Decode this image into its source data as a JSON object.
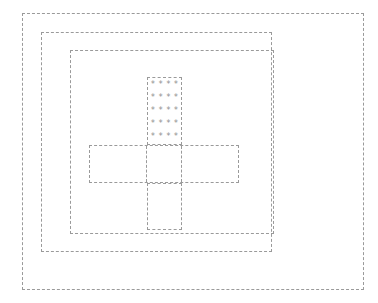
{
  "canvas": {
    "width": 378,
    "height": 303,
    "background_color": "#ffffff",
    "stroke_color": "#9a9a9a",
    "glyph_color": "#8f8f8f",
    "stroke_style": "dashed",
    "stroke_width_px": 1
  },
  "outer_frame": {
    "label": "outer viewport frame",
    "x": 22,
    "y": 13,
    "width": 342,
    "height": 277
  },
  "container_frame": {
    "label": "container frame",
    "x": 40,
    "y": 31,
    "width": 231,
    "height": 220
  },
  "content_frame": {
    "label": "content frame",
    "x": 68,
    "y": 48,
    "width": 204,
    "height": 184
  },
  "asterisk_box": {
    "label": "asterisk grid box",
    "x": 144,
    "y": 74,
    "width": 35,
    "height": 68,
    "rows": 5,
    "columns": 4,
    "glyph": "*",
    "grid": [
      [
        "*",
        "*",
        "*",
        "*"
      ],
      [
        "*",
        "*",
        "*",
        "*"
      ],
      [
        "*",
        "*",
        "*",
        "*"
      ],
      [
        "*",
        "*",
        "*",
        "*"
      ],
      [
        "*",
        "*",
        "*",
        "*"
      ]
    ]
  },
  "crossbar": {
    "label": "horizontal cross bar",
    "x": 86,
    "y": 142,
    "width": 150,
    "height": 38,
    "cells": [
      {
        "id": "bar-cell-1",
        "text": "",
        "width": 58
      },
      {
        "id": "bar-cell-2",
        "text": "",
        "width": 35
      },
      {
        "id": "bar-cell-3",
        "text": "",
        "width": 57
      }
    ]
  },
  "lower_box": {
    "label": "lower vertical box",
    "x": 144,
    "y": 180,
    "width": 35,
    "height": 47,
    "text": ""
  }
}
